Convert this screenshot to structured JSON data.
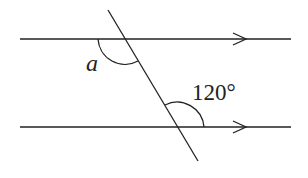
{
  "diagram": {
    "labels": {
      "angle_a": "a",
      "angle_given": "120°"
    },
    "lines": {
      "top": {
        "y": 39,
        "x1": 20,
        "x2": 291,
        "arrow_x": 240
      },
      "bottom": {
        "y": 127,
        "x1": 20,
        "x2": 291,
        "arrow_x": 240
      },
      "transversal": {
        "x1": 108,
        "y1": 10,
        "x2": 198,
        "y2": 161
      }
    },
    "colors": {
      "stroke": "#222222",
      "background": "#ffffff"
    }
  }
}
